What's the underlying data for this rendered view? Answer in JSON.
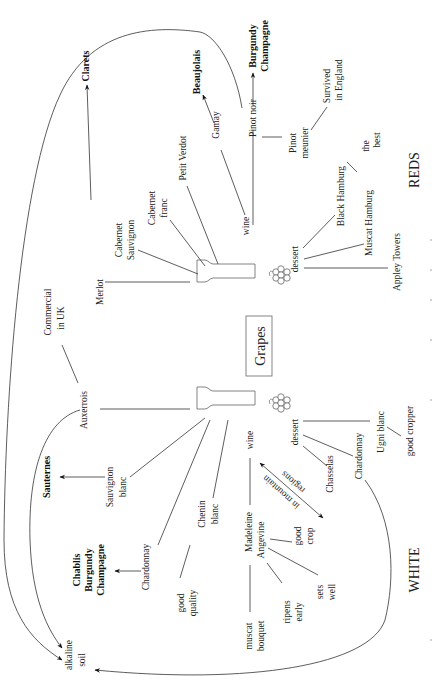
{
  "center": {
    "label": "Grapes"
  },
  "sections": {
    "reds": "REDS",
    "white": "WHITE"
  },
  "reds": {
    "wine_grapes": {
      "merlot": "Merlot",
      "cab_sauv_1": "Cabernet",
      "cab_sauv_2": "Sauvignon",
      "cab_franc_1": "Cabernet",
      "cab_franc_2": "franc",
      "petit_verdot": "Petit Verdot",
      "wine": "wine",
      "gamay": "Gamay",
      "pinot_noir": "Pinot noir",
      "pinot_meunier_1": "Pinot",
      "pinot_meunier_2": "meunier",
      "survived_1": "Survived",
      "survived_2": "in England"
    },
    "regions": {
      "clarets": "Clarets",
      "beaujolais": "Beaujolais",
      "burgundy": "Burgundy",
      "champagne": "Champagne"
    },
    "dessert": {
      "label": "dessert",
      "black_hamburg": "Black Hamburg",
      "the_best_1": "the",
      "the_best_2": "best",
      "muscat_hamburg": "Muscat Hamburg",
      "appley_towers": "Appley Towers"
    }
  },
  "white": {
    "wine_grapes": {
      "auxerrois": "Auxerrois",
      "commercial_1": "Commercial",
      "commercial_2": "in UK",
      "sauv_blanc_1": "Sauvignon",
      "sauv_blanc_2": "blanc",
      "chardonnay": "Chardonnay",
      "chenin_1": "Chenin",
      "chenin_2": "blanc",
      "good_quality_1": "good",
      "good_quality_2": "quality",
      "wine": "wine",
      "madeleine_1": "Madeleine",
      "madeleine_2": "Angevine",
      "good_crop_1": "good",
      "good_crop_2": "crop",
      "sets_well_1": "sets",
      "sets_well_2": "well",
      "ripens_1": "ripens",
      "ripens_2": "early",
      "muscat_1": "muscat",
      "muscat_2": "bouquet",
      "mountain_1": "in mountain",
      "mountain_2": "regions"
    },
    "regions": {
      "sauternes": "Sauternes",
      "chablis": "Chablis",
      "burgundy": "Burgundy",
      "champagne": "Champagne"
    },
    "dessert": {
      "label": "dessert",
      "chasselas": "Chasselas",
      "chardonnay": "Chardonnay",
      "ugni_blanc": "Ugni blanc",
      "good_cropper": "good cropper"
    }
  },
  "soil": {
    "line1": "alkaline",
    "line2": "soil"
  }
}
